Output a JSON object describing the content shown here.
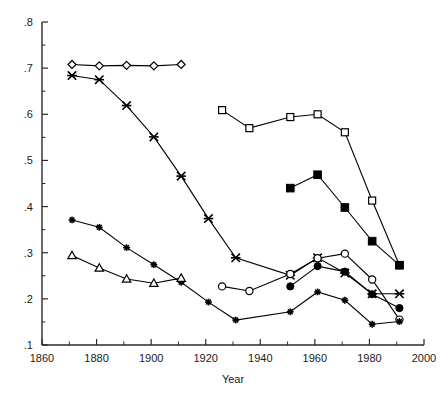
{
  "chart_data": {
    "type": "line",
    "title": "",
    "xlabel": "Year",
    "ylabel": "",
    "xlim": [
      1860,
      2000
    ],
    "ylim": [
      0.1,
      0.8
    ],
    "grid": false,
    "legend": "none",
    "x_ticks": [
      "1860",
      "1880",
      "1900",
      "1920",
      "1940",
      "1960",
      "1980",
      "2000"
    ],
    "x_tick_values": [
      1860,
      1880,
      1900,
      1920,
      1940,
      1960,
      1980,
      2000
    ],
    "x_minor_step": 10,
    "y_ticks": [
      ".1",
      ".2",
      ".3",
      ".4",
      ".5",
      ".6",
      ".7",
      ".8"
    ],
    "y_tick_values": [
      0.1,
      0.2,
      0.3,
      0.4,
      0.5,
      0.6,
      0.7,
      0.8
    ],
    "y_minor_step": 0.05,
    "series": [
      {
        "name": "series-open-diamond",
        "marker": "open-diamond",
        "x": [
          1871,
          1881,
          1891,
          1901,
          1911
        ],
        "values": [
          0.708,
          0.705,
          0.706,
          0.705,
          0.708
        ]
      },
      {
        "name": "series-cross-x",
        "marker": "filled-x",
        "x": [
          1871,
          1881,
          1891,
          1901,
          1911,
          1921,
          1931,
          1951,
          1961,
          1971,
          1981,
          1991
        ],
        "values": [
          0.684,
          0.675,
          0.619,
          0.551,
          0.466,
          0.374,
          0.289,
          0.251,
          0.289,
          0.256,
          0.211,
          0.211
        ]
      },
      {
        "name": "series-open-square",
        "marker": "open-square",
        "x": [
          1926,
          1936,
          1951,
          1961,
          1971,
          1981,
          1991
        ],
        "values": [
          0.609,
          0.57,
          0.594,
          0.6,
          0.561,
          0.413,
          0.273
        ]
      },
      {
        "name": "series-filled-square",
        "marker": "filled-square",
        "x": [
          1951,
          1961,
          1971,
          1981,
          1991
        ],
        "values": [
          0.44,
          0.469,
          0.398,
          0.325,
          0.273
        ]
      },
      {
        "name": "series-open-circle",
        "marker": "open-circle",
        "x": [
          1926,
          1936,
          1951,
          1961,
          1971,
          1981,
          1991
        ],
        "values": [
          0.227,
          0.217,
          0.254,
          0.288,
          0.298,
          0.242,
          0.155
        ]
      },
      {
        "name": "series-filled-circle",
        "marker": "filled-circle",
        "x": [
          1951,
          1961,
          1971,
          1981,
          1991
        ],
        "values": [
          0.227,
          0.271,
          0.259,
          0.21,
          0.18
        ]
      },
      {
        "name": "series-plus",
        "marker": "filled-plus",
        "x": [
          1871,
          1881,
          1891,
          1901,
          1911,
          1921,
          1931,
          1951,
          1961,
          1971,
          1981,
          1991
        ],
        "values": [
          0.371,
          0.355,
          0.311,
          0.274,
          0.236,
          0.193,
          0.154,
          0.172,
          0.215,
          0.197,
          0.145,
          0.151
        ]
      },
      {
        "name": "series-open-triangle",
        "marker": "open-triangle",
        "x": [
          1871,
          1881,
          1891,
          1901,
          1911
        ],
        "values": [
          0.294,
          0.267,
          0.243,
          0.234,
          0.245
        ]
      }
    ]
  }
}
